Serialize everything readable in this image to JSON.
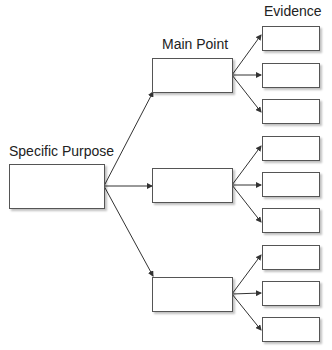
{
  "labels": {
    "specific_purpose": "Specific Purpose",
    "main_point": "Main Point",
    "evidence": "Evidence"
  },
  "structure": {
    "root": "Specific Purpose",
    "main_points": [
      {
        "evidence_count": 3
      },
      {
        "evidence_count": 3
      },
      {
        "evidence_count": 3
      }
    ]
  },
  "colors": {
    "line": "#333333",
    "box_border": "#555555",
    "background": "#ffffff"
  }
}
